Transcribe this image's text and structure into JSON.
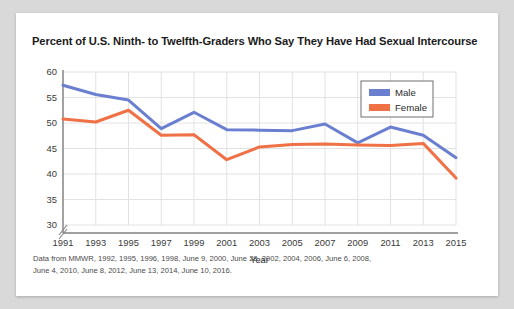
{
  "card": {
    "title": "Percent of U.S. Ninth- to Twelfth-Graders Who Say They Have Had Sexual Intercourse",
    "source_line_1": "Data from MMWR, 1992, 1995, 1996, 1998, June 9, 2000, June 28, 2002, 2004, 2006, June 6, 2008,",
    "source_line_2": "June 4, 2010, June 8, 2012, June 13, 2014, June 10, 2016."
  },
  "chart_data": {
    "type": "line",
    "title": "Percent of U.S. Ninth- to Twelfth-Graders Who Say They Have Had Sexual Intercourse",
    "xlabel": "Year",
    "ylabel": "",
    "categories": [
      1991,
      1993,
      1995,
      1997,
      1999,
      2001,
      2003,
      2005,
      2007,
      2009,
      2011,
      2013,
      2015
    ],
    "x": [
      "1991",
      "1993",
      "1995",
      "1997",
      "1999",
      "2001",
      "2003",
      "2005",
      "2007",
      "2009",
      "2011",
      "2013",
      "2015"
    ],
    "xlim": [
      1991,
      2015
    ],
    "ylim": [
      30,
      60
    ],
    "yticks": [
      30,
      35,
      40,
      45,
      50,
      55,
      60
    ],
    "xticks": [
      "1991",
      "1993",
      "1995",
      "1997",
      "1999",
      "2001",
      "2003",
      "2005",
      "2007",
      "2009",
      "2011",
      "2013",
      "2015"
    ],
    "grid": true,
    "y_axis_break": true,
    "legend_position": "top-right",
    "series": [
      {
        "name": "Male",
        "color": "#6b7fd0",
        "values": [
          57.4,
          55.6,
          54.5,
          48.9,
          52.1,
          48.7,
          48.6,
          48.5,
          49.8,
          46.1,
          49.2,
          47.6,
          43.2
        ]
      },
      {
        "name": "Female",
        "color": "#ef7145",
        "values": [
          50.8,
          50.2,
          52.5,
          47.6,
          47.7,
          42.8,
          45.3,
          45.8,
          45.9,
          45.7,
          45.6,
          46.0,
          39.2
        ]
      }
    ],
    "legend": [
      {
        "label": "Male",
        "color": "#6b7fd0"
      },
      {
        "label": "Female",
        "color": "#ef7145"
      }
    ]
  }
}
